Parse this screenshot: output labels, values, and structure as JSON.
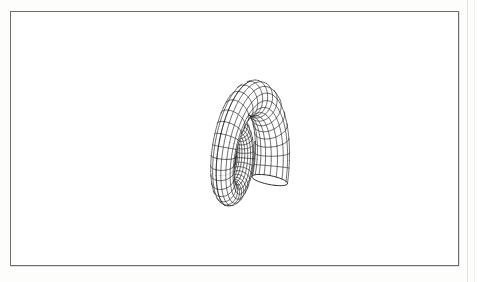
{
  "figure": {
    "caption_text": "",
    "title": "",
    "description": "Three-dimensional wireframe mesh rendering of a seashell surface",
    "background_color": "#ffffff",
    "line_color": "#1b1b1b",
    "frame_color": "#6d6d6d",
    "scan_margin_color": "#fdfdfc"
  },
  "frame": {
    "x": 10,
    "y": 11,
    "width": 449,
    "height": 255,
    "border_width": 1
  },
  "chart_data": {
    "type": "scatter",
    "title": "",
    "xlabel": "",
    "ylabel": "",
    "render_style": "wireframe-quad-mesh",
    "surface": "logarithmic-spiral-shell",
    "projection": "orthographic-3d",
    "geometry": {
      "turns": 2.35,
      "spiral_growth_per_turn": 2.05,
      "tube_aspect": 0.78,
      "tube_radius_scale": 0.33,
      "apex_direction": "right",
      "aperture_direction": "left",
      "u_samples": 150,
      "v_samples": 34,
      "u_gridlines": 74,
      "v_gridlines": 20
    },
    "view": {
      "center_x": 249,
      "center_y": 142,
      "scale": 96,
      "yaw_deg": -18,
      "pitch_deg": 20,
      "roll_deg": -8
    },
    "bounds_px": {
      "left": 128,
      "right": 372,
      "top": 80,
      "bottom": 206
    },
    "legend": [],
    "annotations": [],
    "grid": false
  }
}
